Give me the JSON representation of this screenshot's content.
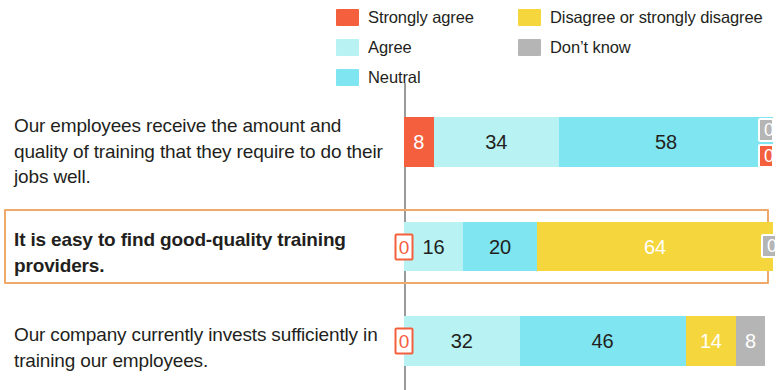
{
  "legend": {
    "columns": [
      {
        "name": "legend-column-left",
        "items": [
          {
            "label": "Strongly agree",
            "color": "#f4603e",
            "key": "strongly_agree"
          },
          {
            "label": "Agree",
            "color": "#b8f2f2",
            "key": "agree"
          },
          {
            "label": "Neutral",
            "color": "#7fe5f0",
            "key": "neutral"
          }
        ]
      },
      {
        "name": "legend-column-right",
        "items": [
          {
            "label": "Disagree or strongly disagree",
            "color": "#f5d63c",
            "key": "disagree"
          },
          {
            "label": "Don’t know",
            "color": "#b5b5b5",
            "key": "dont_know"
          }
        ]
      }
    ]
  },
  "rows": [
    {
      "label": "Our employees receive the amount and quality of training that they require to do their jobs well.",
      "highlighted": false,
      "segments": [
        {
          "key": "strongly_agree",
          "value": "8",
          "percent": 8,
          "color": "#f4603e",
          "text": "light"
        },
        {
          "key": "agree",
          "value": "34",
          "percent": 34,
          "color": "#b8f2f2",
          "text": "dark"
        },
        {
          "key": "neutral",
          "value": "58",
          "percent": 58,
          "color": "#7fe5f0",
          "text": "dark"
        }
      ],
      "edge_chips": [
        {
          "key": "dont_know",
          "value": "0",
          "style": "grey"
        },
        {
          "key": "disagree",
          "value": "0",
          "style": "orange"
        }
      ],
      "zero_chip": null
    },
    {
      "label": "It is easy to find good-quality training providers.",
      "highlighted": true,
      "segments": [
        {
          "key": "agree",
          "value": "16",
          "percent": 16,
          "color": "#b8f2f2",
          "text": "dark"
        },
        {
          "key": "neutral",
          "value": "20",
          "percent": 20,
          "color": "#7fe5f0",
          "text": "dark"
        },
        {
          "key": "disagree",
          "value": "64",
          "percent": 64,
          "color": "#f5d63c",
          "text": "light"
        }
      ],
      "edge_chips": [
        {
          "key": "dont_know",
          "value": "0",
          "style": "grey"
        }
      ],
      "zero_chip": {
        "key": "strongly_agree",
        "value": "0"
      }
    },
    {
      "label": "Our company currently invests sufficiently in training our employees.",
      "highlighted": false,
      "segments": [
        {
          "key": "agree",
          "value": "32",
          "percent": 32,
          "color": "#b8f2f2",
          "text": "dark"
        },
        {
          "key": "neutral",
          "value": "46",
          "percent": 46,
          "color": "#7fe5f0",
          "text": "dark"
        },
        {
          "key": "disagree",
          "value": "14",
          "percent": 14,
          "color": "#f5d63c",
          "text": "light"
        },
        {
          "key": "dont_know",
          "value": "8",
          "percent": 8,
          "color": "#b5b5b5",
          "text": "light"
        }
      ],
      "edge_chips": [],
      "zero_chip": {
        "key": "strongly_agree",
        "value": "0"
      }
    }
  ],
  "chart_data": {
    "type": "bar",
    "title": "",
    "subtitle": "",
    "orientation": "horizontal",
    "stacked": true,
    "stack_total": 100,
    "xlabel": "",
    "ylabel": "",
    "xlim": [
      0,
      100
    ],
    "grid": false,
    "legend_position": "top",
    "note": "100% stacked bar chart; right edge of the figure is cropped so the final segments of rows 1 and 2 are only partially visible.",
    "categories": [
      "Our employees receive the amount and quality of training that they require to do their jobs well.",
      "It is easy to find good-quality training providers.",
      "Our company currently invests sufficiently in training our employees."
    ],
    "series": [
      {
        "name": "Strongly agree",
        "color": "#f4603e",
        "values": [
          8,
          0,
          0
        ]
      },
      {
        "name": "Agree",
        "color": "#b8f2f2",
        "values": [
          34,
          16,
          32
        ]
      },
      {
        "name": "Neutral",
        "color": "#7fe5f0",
        "values": [
          58,
          20,
          46
        ]
      },
      {
        "name": "Disagree or strongly disagree",
        "color": "#f5d63c",
        "values": [
          0,
          64,
          14
        ]
      },
      {
        "name": "Don’t know",
        "color": "#b5b5b5",
        "values": [
          0,
          0,
          8
        ]
      }
    ],
    "highlighted_category_index": 1
  }
}
